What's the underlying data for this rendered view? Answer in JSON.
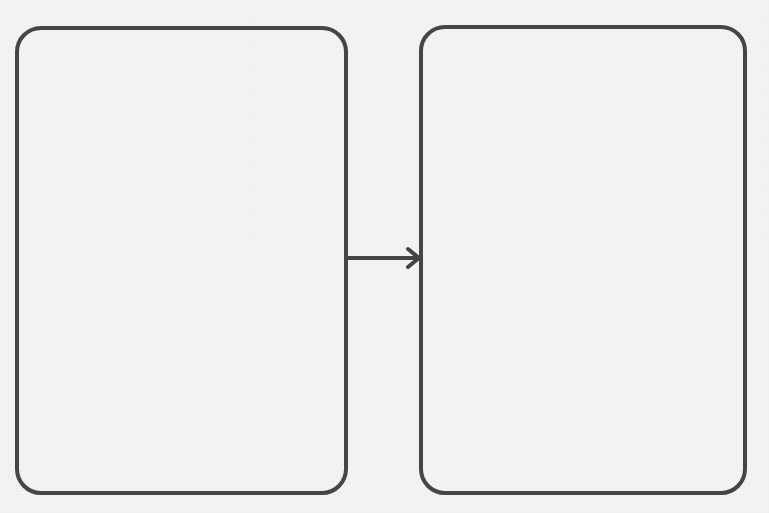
{
  "diagram": {
    "type": "flow",
    "direction": "left-to-right",
    "nodes": [
      {
        "id": "left",
        "label": "",
        "shape": "rounded-rectangle"
      },
      {
        "id": "right",
        "label": "",
        "shape": "rounded-rectangle"
      }
    ],
    "edges": [
      {
        "from": "left",
        "to": "right",
        "style": "arrow",
        "label": ""
      }
    ],
    "colors": {
      "stroke": "#454545",
      "background": "#f3f3f1"
    }
  }
}
